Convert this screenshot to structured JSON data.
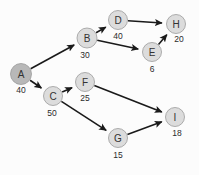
{
  "diagram": {
    "type": "directed-graph",
    "title": "",
    "background_color": "#fcfcfc",
    "node_fill_default": "#dcdcdc",
    "node_fill_highlight": "#b8b8b8",
    "node_stroke_color": "#9a9a9a",
    "edge_color": "#1a1a1a",
    "nodes": [
      {
        "id": "A",
        "label": "A",
        "value": "40",
        "cx": 21,
        "cy": 74,
        "r": 10.5,
        "highlight": true,
        "value_dx": 0,
        "value_dy": 16
      },
      {
        "id": "B",
        "label": "B",
        "value": "30",
        "cx": 87,
        "cy": 38,
        "r": 10.0,
        "highlight": false,
        "value_dx": -2,
        "value_dy": 17
      },
      {
        "id": "C",
        "label": "C",
        "value": "50",
        "cx": 53,
        "cy": 96,
        "r": 9.5,
        "highlight": false,
        "value_dx": -1,
        "value_dy": 17
      },
      {
        "id": "D",
        "label": "D",
        "value": "40",
        "cx": 118,
        "cy": 20,
        "r": 9.5,
        "highlight": false,
        "value_dx": 0,
        "value_dy": 16
      },
      {
        "id": "E",
        "label": "E",
        "value": "6",
        "cx": 152,
        "cy": 52,
        "r": 9.5,
        "highlight": false,
        "value_dx": 0,
        "value_dy": 17
      },
      {
        "id": "F",
        "label": "F",
        "value": "25",
        "cx": 85,
        "cy": 82,
        "r": 9.5,
        "highlight": false,
        "value_dx": 0,
        "value_dy": 16
      },
      {
        "id": "G",
        "label": "G",
        "value": "15",
        "cx": 118,
        "cy": 138,
        "r": 9.5,
        "highlight": false,
        "value_dx": 0,
        "value_dy": 17
      },
      {
        "id": "H",
        "label": "H",
        "value": "20",
        "cx": 176,
        "cy": 24,
        "r": 9.5,
        "highlight": false,
        "value_dx": 3,
        "value_dy": 15
      },
      {
        "id": "I",
        "label": "I",
        "value": "18",
        "cx": 175,
        "cy": 117,
        "r": 9.5,
        "highlight": false,
        "value_dx": 2,
        "value_dy": 16
      }
    ],
    "edges": [
      {
        "from": "A",
        "to": "B",
        "label": ""
      },
      {
        "from": "A",
        "to": "C",
        "label": ""
      },
      {
        "from": "B",
        "to": "D",
        "label": ""
      },
      {
        "from": "B",
        "to": "E",
        "label": ""
      },
      {
        "from": "C",
        "to": "F",
        "label": ""
      },
      {
        "from": "C",
        "to": "G",
        "label": ""
      },
      {
        "from": "D",
        "to": "H",
        "label": ""
      },
      {
        "from": "E",
        "to": "H",
        "label": ""
      },
      {
        "from": "F",
        "to": "I",
        "label": ""
      },
      {
        "from": "G",
        "to": "I",
        "label": ""
      }
    ]
  }
}
